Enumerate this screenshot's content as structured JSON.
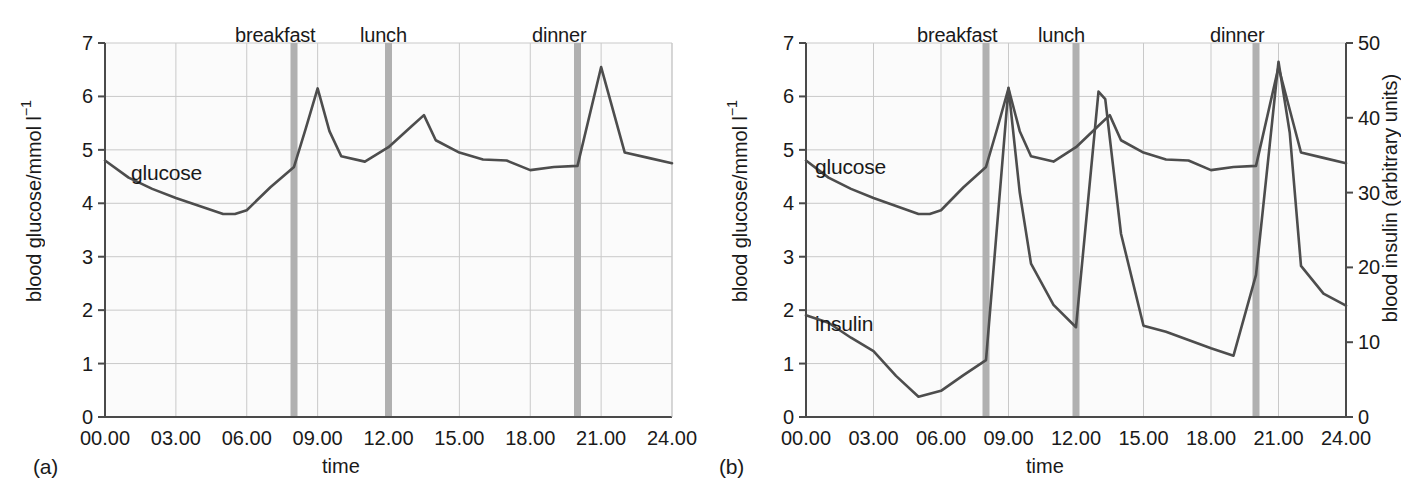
{
  "figure": {
    "panels": [
      {
        "tag": "(a)",
        "xlabel": "time",
        "ylabel_left": "blood glucose/mmol l",
        "ylabel_left_sup": "−1",
        "ylabel_right": null,
        "meal_labels": [
          "breakfast",
          "lunch",
          "dinner"
        ],
        "series_labels": [
          "glucose"
        ]
      },
      {
        "tag": "(b)",
        "xlabel": "time",
        "ylabel_left": "blood glucose/mmol l",
        "ylabel_left_sup": "−1",
        "ylabel_right": "blood insulin (arbitrary units)",
        "meal_labels": [
          "breakfast",
          "lunch",
          "dinner"
        ],
        "series_labels": [
          "glucose",
          "insulin"
        ]
      }
    ],
    "colors": {
      "line": "#4d4d4d",
      "grid": "#c9c9c9",
      "axis": "#4a4a4a",
      "meal_bar": "#b0b0b0",
      "plot_background": "#fbfbfb",
      "text": "#1a1a1a"
    }
  },
  "chart_data": [
    {
      "type": "line",
      "title": "",
      "panel": "(a)",
      "xlabel": "time",
      "ylabel": "blood glucose/mmol l−1",
      "xlim": [
        0,
        24
      ],
      "ylim": [
        0,
        7
      ],
      "xticks": [
        0,
        3,
        6,
        9,
        12,
        15,
        18,
        21,
        24
      ],
      "xticklabels": [
        "00.00",
        "03.00",
        "06.00",
        "09.00",
        "12.00",
        "15.00",
        "18.00",
        "21.00",
        "24.00"
      ],
      "yticks": [
        0,
        1,
        2,
        3,
        4,
        5,
        6,
        7
      ],
      "yticklabels": [
        "0",
        "1",
        "2",
        "3",
        "4",
        "5",
        "6",
        "7"
      ],
      "grid": true,
      "legend": "inline-annotation",
      "annotations": [
        {
          "text": "breakfast",
          "x": 8.0,
          "type": "meal-marker"
        },
        {
          "text": "lunch",
          "x": 12.0,
          "type": "meal-marker"
        },
        {
          "text": "dinner",
          "x": 20.0,
          "type": "meal-marker"
        },
        {
          "text": "glucose",
          "x": 2.4,
          "y": 4.62,
          "type": "series-label"
        }
      ],
      "meal_times": [
        8.0,
        12.0,
        20.0
      ],
      "series": [
        {
          "name": "glucose",
          "units": "mmol l-1",
          "axis": "left",
          "x": [
            0.0,
            1.0,
            2.0,
            3.0,
            4.0,
            5.0,
            5.5,
            6.0,
            7.0,
            8.0,
            8.5,
            9.0,
            9.5,
            10.0,
            11.0,
            12.0,
            13.0,
            13.5,
            14.0,
            15.0,
            16.0,
            17.0,
            18.0,
            19.0,
            20.0,
            21.0,
            22.0,
            23.0,
            24.0
          ],
          "values": [
            4.8,
            4.48,
            4.27,
            4.1,
            3.95,
            3.8,
            3.8,
            3.87,
            4.3,
            4.68,
            5.4,
            6.15,
            5.35,
            4.88,
            4.78,
            5.05,
            5.45,
            5.65,
            5.18,
            4.95,
            4.82,
            4.8,
            4.62,
            4.68,
            4.7,
            6.55,
            4.95,
            4.85,
            4.75
          ]
        }
      ]
    },
    {
      "type": "line",
      "title": "",
      "panel": "(b)",
      "xlabel": "time",
      "ylabel": "blood glucose/mmol l−1",
      "ylabel_right": "blood insulin (arbitrary units)",
      "xlim": [
        0,
        24
      ],
      "ylim": [
        0,
        7
      ],
      "ylim_right": [
        0,
        50
      ],
      "xticks": [
        0,
        3,
        6,
        9,
        12,
        15,
        18,
        21,
        24
      ],
      "xticklabels": [
        "00.00",
        "03.00",
        "06.00",
        "09.00",
        "12.00",
        "15.00",
        "18.00",
        "21.00",
        "24.00"
      ],
      "yticks": [
        0,
        1,
        2,
        3,
        4,
        5,
        6,
        7
      ],
      "yticklabels": [
        "0",
        "1",
        "2",
        "3",
        "4",
        "5",
        "6",
        "7"
      ],
      "yticks_right": [
        0,
        10,
        20,
        30,
        40,
        50
      ],
      "yticklabels_right": [
        "0",
        "10",
        "20",
        "30",
        "40",
        "50"
      ],
      "grid": true,
      "legend": "inline-annotation",
      "annotations": [
        {
          "text": "breakfast",
          "x": 8.0,
          "type": "meal-marker"
        },
        {
          "text": "lunch",
          "x": 12.0,
          "type": "meal-marker"
        },
        {
          "text": "dinner",
          "x": 20.0,
          "type": "meal-marker"
        },
        {
          "text": "glucose",
          "x": 2.2,
          "y": 4.6,
          "type": "series-label"
        },
        {
          "text": "insulin",
          "x": 2.2,
          "y": 1.72,
          "type": "series-label"
        }
      ],
      "meal_times": [
        8.0,
        12.0,
        20.0
      ],
      "series": [
        {
          "name": "glucose",
          "units": "mmol l-1",
          "axis": "left",
          "x": [
            0.0,
            1.0,
            2.0,
            3.0,
            4.0,
            5.0,
            5.5,
            6.0,
            7.0,
            8.0,
            8.5,
            9.0,
            9.5,
            10.0,
            11.0,
            12.0,
            13.0,
            13.5,
            14.0,
            15.0,
            16.0,
            17.0,
            18.0,
            19.0,
            20.0,
            21.0,
            22.0,
            23.0,
            24.0
          ],
          "values": [
            4.8,
            4.48,
            4.27,
            4.1,
            3.95,
            3.8,
            3.8,
            3.87,
            4.3,
            4.68,
            5.4,
            6.15,
            5.35,
            4.88,
            4.78,
            5.05,
            5.45,
            5.65,
            5.18,
            4.95,
            4.82,
            4.8,
            4.62,
            4.68,
            4.7,
            6.55,
            4.95,
            4.85,
            4.75
          ]
        },
        {
          "name": "insulin",
          "units": "arbitrary units",
          "axis": "right",
          "x": [
            0.0,
            1.0,
            2.0,
            3.0,
            4.0,
            5.0,
            6.0,
            7.0,
            8.0,
            9.0,
            9.5,
            10.0,
            11.0,
            12.0,
            13.0,
            13.3,
            14.0,
            15.0,
            16.0,
            17.0,
            18.0,
            19.0,
            20.0,
            21.0,
            21.5,
            22.0,
            23.0,
            24.0
          ],
          "values": [
            13.6,
            12.6,
            10.6,
            8.8,
            5.5,
            2.7,
            3.5,
            5.6,
            7.6,
            44.0,
            30.0,
            20.5,
            15.0,
            12.0,
            43.5,
            42.5,
            24.5,
            12.2,
            11.4,
            10.3,
            9.2,
            8.2,
            19.0,
            47.5,
            38.0,
            20.2,
            16.5,
            14.9
          ]
        }
      ]
    }
  ]
}
